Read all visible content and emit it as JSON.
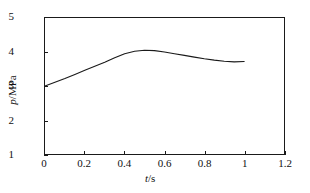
{
  "chart_data": {
    "type": "line",
    "title": "",
    "xlabel": "t/s",
    "ylabel": "p/MPa",
    "xlabel_italic_symbol": "t",
    "xlabel_unit": "/s",
    "ylabel_italic_symbol": "p",
    "ylabel_unit": "/MPa",
    "xlim": [
      0,
      1.2
    ],
    "ylim": [
      1,
      5
    ],
    "xticks": [
      "0",
      "0.2",
      "0.4",
      "0.6",
      "0.8",
      "1",
      "1.2"
    ],
    "xtick_values": [
      0,
      0.2,
      0.4,
      0.6,
      0.8,
      1,
      1.2
    ],
    "yticks": [
      "1",
      "2",
      "3",
      "4",
      "5"
    ],
    "ytick_values": [
      1,
      2,
      3,
      4,
      5
    ],
    "grid": false,
    "legend": null,
    "line_color": "#1a1a1a",
    "frame_color": "#1a1a1a",
    "background_color": "#ffffff",
    "series": [
      {
        "name": "pressure",
        "x": [
          0.0,
          0.05,
          0.1,
          0.15,
          0.2,
          0.25,
          0.3,
          0.35,
          0.4,
          0.45,
          0.5,
          0.55,
          0.6,
          0.65,
          0.7,
          0.75,
          0.8,
          0.85,
          0.9,
          0.95,
          1.0
        ],
        "y": [
          3.0,
          3.11,
          3.22,
          3.34,
          3.46,
          3.58,
          3.7,
          3.83,
          3.95,
          4.02,
          4.05,
          4.04,
          4.0,
          3.95,
          3.9,
          3.85,
          3.8,
          3.76,
          3.73,
          3.71,
          3.72
        ]
      }
    ]
  }
}
